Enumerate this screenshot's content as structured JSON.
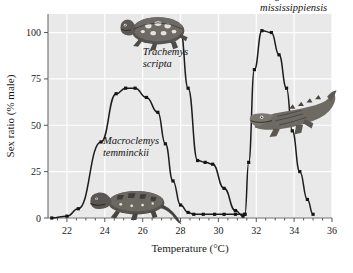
{
  "figure": {
    "background_color": "#e9e9e9",
    "page_color": "#ffffff",
    "line_color": "#1c1c1c",
    "grid_color": "#ffffff"
  },
  "chart_data": {
    "type": "line",
    "title": "",
    "xlabel": "Temperature (°C)",
    "ylabel": "Sex ratio (% male)",
    "xlim": [
      21.0,
      36.0
    ],
    "ylim": [
      0,
      110
    ],
    "xticks": [
      22,
      24,
      26,
      28,
      30,
      32,
      34,
      36
    ],
    "yticks": [
      0,
      25,
      50,
      75,
      100
    ],
    "xtick_labels": [
      "22",
      "24",
      "26",
      "28",
      "30",
      "32",
      "34",
      "36"
    ],
    "ytick_labels": [
      "0",
      "25",
      "50",
      "75",
      "100"
    ],
    "grid": true,
    "legend": "none",
    "series": [
      {
        "name": "Macroclemys temminckii",
        "label": "Macroclemys temminckii",
        "x": [
          21.2,
          22.0,
          22.6,
          23.8,
          24.6,
          25.1,
          25.6,
          26.2,
          26.8,
          27.2,
          27.6,
          28.0,
          28.4,
          28.7,
          29.2,
          29.8,
          30.3,
          30.9,
          31.4
        ],
        "y": [
          0,
          1,
          5,
          41,
          67,
          70,
          70,
          65,
          57,
          40,
          20,
          7,
          3,
          2,
          2,
          2,
          2,
          2,
          2
        ]
      },
      {
        "name": "Trachemys scripta",
        "label": "Trachemys scripta",
        "x": [
          25.8,
          26.6,
          27.4,
          28.0,
          28.4,
          28.9,
          29.3,
          29.7,
          30.3,
          30.9,
          31.3
        ],
        "y": [
          101,
          101,
          101,
          101,
          70,
          31,
          30,
          29,
          16,
          4,
          1
        ]
      },
      {
        "name": "Alligator mississippiensis",
        "label": "Alligator mississippiensis",
        "x": [
          31.4,
          31.6,
          31.9,
          32.3,
          32.8,
          33.2,
          33.6,
          33.9,
          34.3,
          34.7,
          35.0
        ],
        "y": [
          2,
          30,
          80,
          101,
          100,
          88,
          70,
          47,
          25,
          10,
          2
        ]
      }
    ],
    "annotations": [
      {
        "text": "Trachemys scripta",
        "x": 26.0,
        "y": 88
      },
      {
        "text": "Macroclemys temminckii",
        "x": 23.9,
        "y": 40
      },
      {
        "text": "Alligator mississippiensis",
        "x": 32.2,
        "y": 118
      }
    ]
  },
  "illustrations": [
    {
      "name": "trachemys-slider-turtle",
      "alt": "spotted slider turtle"
    },
    {
      "name": "macroclemys-snapping-turtle",
      "alt": "alligator snapping turtle"
    },
    {
      "name": "alligator",
      "alt": "American alligator"
    }
  ]
}
